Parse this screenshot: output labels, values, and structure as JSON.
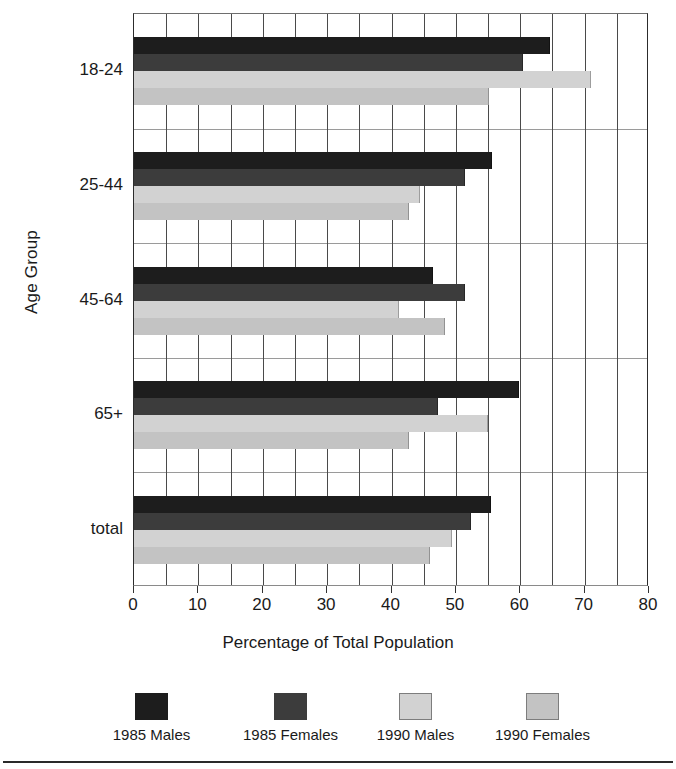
{
  "chart_data": {
    "type": "bar",
    "orientation": "horizontal",
    "title": "",
    "xlabel": "Percentage of Total Population",
    "ylabel": "Age Group",
    "categories": [
      "18-24",
      "25-44",
      "45-64",
      "65+",
      "total"
    ],
    "series": [
      {
        "name": "1985 Males",
        "color": "#1d1d1d",
        "values": [
          64.4,
          55.4,
          46.3,
          59.6,
          55.3
        ]
      },
      {
        "name": "1985 Females",
        "color": "#3c3c3c",
        "values": [
          60.2,
          51.3,
          51.2,
          47.0,
          52.2
        ]
      },
      {
        "name": "1990 Males",
        "color": "#d2d2d2",
        "values": [
          70.8,
          44.3,
          41.0,
          54.9,
          49.2
        ]
      },
      {
        "name": "1990 Females",
        "color": "#c3c3c3",
        "values": [
          55.0,
          42.6,
          48.2,
          42.6,
          45.8
        ]
      }
    ],
    "xlim": [
      0,
      80
    ],
    "xticks": [
      0,
      10,
      20,
      30,
      40,
      50,
      60,
      70,
      80
    ],
    "xticks_minor_step": 5,
    "grid": {
      "vertical": true,
      "horizontal": true
    },
    "legend_position": "bottom"
  }
}
